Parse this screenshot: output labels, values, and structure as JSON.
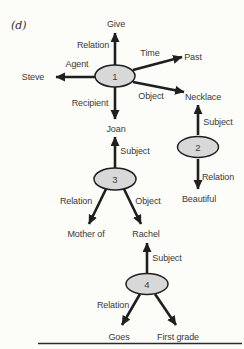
{
  "panel_label": "(d)",
  "colors": {
    "background": "#fcfcf9",
    "node_fill": "#d8d8d8",
    "line": "#1f1f1f",
    "text": "#3a3a3a"
  },
  "network": {
    "nodes": [
      "1",
      "2",
      "3",
      "4"
    ],
    "concepts": [
      "Give",
      "Past",
      "Steve",
      "Necklace",
      "Joan",
      "Beautiful",
      "Mother of",
      "Rachel",
      "Goes",
      "First grade"
    ],
    "edges": [
      {
        "from": "1",
        "relation": "Relation",
        "to": "Give"
      },
      {
        "from": "1",
        "relation": "Time",
        "to": "Past"
      },
      {
        "from": "1",
        "relation": "Agent",
        "to": "Steve"
      },
      {
        "from": "1",
        "relation": "Object",
        "to": "Necklace"
      },
      {
        "from": "1",
        "relation": "Recipient",
        "to": "Joan"
      },
      {
        "from": "2",
        "relation": "Subject",
        "to": "Necklace"
      },
      {
        "from": "2",
        "relation": "Relation",
        "to": "Beautiful"
      },
      {
        "from": "3",
        "relation": "Subject",
        "to": "Joan"
      },
      {
        "from": "3",
        "relation": "Relation",
        "to": "Mother of"
      },
      {
        "from": "3",
        "relation": "Object",
        "to": "Rachel"
      },
      {
        "from": "4",
        "relation": "Subject",
        "to": "Rachel"
      },
      {
        "from": "4",
        "relation": "Relation",
        "to": "Goes"
      },
      {
        "from": "4",
        "relation": "",
        "to": "First grade"
      }
    ]
  }
}
